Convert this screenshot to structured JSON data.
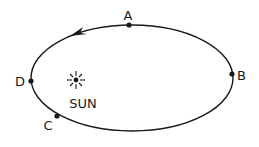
{
  "diagram": {
    "title": "",
    "orbit": {
      "shape": "ellipse",
      "direction": "counterclockwise",
      "stroke_color": "#1a1a1a"
    },
    "sun": {
      "label": "SUN"
    },
    "points": [
      {
        "id": "A",
        "label": "A"
      },
      {
        "id": "B",
        "label": "B"
      },
      {
        "id": "C",
        "label": "C"
      },
      {
        "id": "D",
        "label": "D"
      }
    ]
  }
}
